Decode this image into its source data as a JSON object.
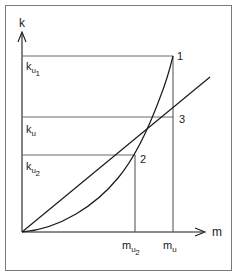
{
  "figure": {
    "type": "line-diagram",
    "background_color": "#ffffff",
    "stroke_color": "#1a1a1a",
    "frame_color": "#7a7a7a",
    "axes": {
      "y_axis_label": "k",
      "x_axis_label": "m",
      "origin_px": [
        22,
        232
      ],
      "y_axis_top_px": 32,
      "x_axis_right_px": 205
    },
    "y_levels": [
      {
        "id": "k_u1",
        "base": "k",
        "sub_a": "u",
        "sub_b": "1",
        "y_px": 56,
        "x_end_px": 173
      },
      {
        "id": "k_u",
        "base": "k",
        "sub_a": "u",
        "sub_b": "",
        "y_px": 117,
        "x_end_px": 173
      },
      {
        "id": "k_u2",
        "base": "k",
        "sub_a": "u",
        "sub_b": "2",
        "y_px": 155,
        "x_end_px": 135
      }
    ],
    "x_levels": [
      {
        "id": "m_u2",
        "base": "m",
        "sub_a": "u",
        "sub_b": "2",
        "x_px": 135,
        "y_top_px": 155
      },
      {
        "id": "m_u",
        "base": "m",
        "sub_a": "u",
        "sub_b": "",
        "x_px": 173,
        "y_top_px": 56
      }
    ],
    "points": [
      {
        "label": "1",
        "x_px": 173,
        "y_px": 56,
        "desc": "curve meets k_u1 at m_u"
      },
      {
        "label": "3",
        "x_px": 173,
        "y_px": 117,
        "desc": "straight line meets k_u at m_u"
      },
      {
        "label": "2",
        "x_px": 135,
        "y_px": 155,
        "desc": "curve and line intersect at k_u2 / m_u2"
      }
    ],
    "curves": [
      {
        "name": "exponential-curve",
        "description": "convex rising curve from origin through point 2 to point 1",
        "path": "M 22 232 C 60 229, 96 205, 118 178 C 134 159, 150 125, 161 95 C 168 77, 171 64, 173 56"
      },
      {
        "name": "straight-line",
        "description": "straight line from origin through points 2 and 3 extending beyond axis",
        "path": "M 22 232 L 210 77"
      }
    ]
  },
  "labels": {
    "y_axis": "k",
    "x_axis": "m",
    "point_1": "1",
    "point_2": "2",
    "point_3": "3"
  }
}
